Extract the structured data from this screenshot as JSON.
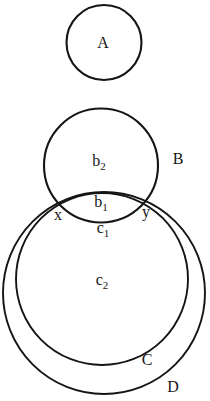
{
  "figure": {
    "kind": "euler-set-diagram",
    "background": "#ffffff",
    "ink": "#151515",
    "circles": [
      {
        "name": "A",
        "cx": 104,
        "cy": 42.5,
        "r": 37.5,
        "stroke_width": 2.1
      },
      {
        "name": "B",
        "cx": 101,
        "cy": 165.5,
        "r": 57,
        "stroke_width": 2.1
      },
      {
        "name": "C",
        "cx": 102,
        "cy": 279,
        "r": 86,
        "stroke_width": 1.9
      },
      {
        "name": "D",
        "cx": 104,
        "cy": 293,
        "r": 101,
        "stroke_width": 1.9
      }
    ],
    "labels": [
      {
        "name": "A",
        "base": "A",
        "sub": "",
        "x": 103,
        "y": 48
      },
      {
        "name": "b2",
        "base": "b",
        "sub": "2",
        "x": 99,
        "y": 166
      },
      {
        "name": "B",
        "base": "B",
        "sub": "",
        "x": 178,
        "y": 164
      },
      {
        "name": "b1",
        "base": "b",
        "sub": "1",
        "x": 101,
        "y": 207
      },
      {
        "name": "x",
        "base": "x",
        "sub": "",
        "x": 58,
        "y": 220
      },
      {
        "name": "y",
        "base": "y",
        "sub": "",
        "x": 146,
        "y": 217
      },
      {
        "name": "c1",
        "base": "c",
        "sub": "1",
        "x": 103,
        "y": 233
      },
      {
        "name": "c2",
        "base": "c",
        "sub": "2",
        "x": 102,
        "y": 285
      },
      {
        "name": "C",
        "base": "C",
        "sub": "",
        "x": 147,
        "y": 365
      },
      {
        "name": "D",
        "base": "D",
        "sub": "",
        "x": 173,
        "y": 392
      }
    ]
  }
}
